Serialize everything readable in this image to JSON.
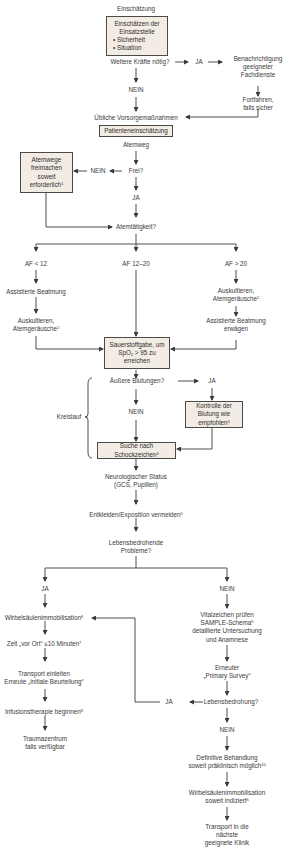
{
  "flowchart": {
    "title": "Einschätzung",
    "scene_box": {
      "heading": "Einschätzen der",
      "heading2": "Einsatzstelle",
      "bullets": [
        "• Sicherheit",
        "• Situation"
      ]
    },
    "more_forces_question": "Weitere Kräfte nötig?",
    "more_forces_yes": "JA",
    "notify": [
      "Benachrichtigung",
      "geeigneter",
      "Fachdienste"
    ],
    "continue_safe": [
      "Fortfahren,",
      "falls sicher"
    ],
    "more_forces_no": "NEIN",
    "usual_precautions": "Übliche Vorsorgemaßnahmen",
    "patient_assessment": "Patienteneinschätzung",
    "airway": "Atemweg",
    "airway_question": "Frei?",
    "airway_no": "NEIN",
    "airway_yes": "JA",
    "clear_airway_box": [
      "Atemwege",
      "freimachen",
      "soweit",
      "erforderlich"
    ],
    "clear_airway_note": "1",
    "breathing_question": "Atemtätigkeit?",
    "branches": {
      "low": {
        "label": "AF < 12",
        "step1": "Assistierte Beatmung",
        "step2": [
          "Auskultieren,",
          "Atemgeräusche"
        ],
        "step2_note": "2"
      },
      "normal": {
        "label": "AF 12–20"
      },
      "high": {
        "label": "AF > 20",
        "step1": [
          "Auskultieren,",
          "Atemgeräusche"
        ],
        "step1_note": "2",
        "step2": [
          "Assistierte Beatmung",
          "erwägen"
        ]
      }
    },
    "oxygen_box": {
      "line1": "Sauerstoffgabe, um",
      "line2_pre": "SpO",
      "line2_sub": "2",
      "line2_post": " > 95 zu",
      "line3": "erreichen"
    },
    "circulation_label": "Kreislauf",
    "bleeding_question": "Äußere Blutungen?",
    "bleeding_yes": "JA",
    "bleeding_no": "NEIN",
    "bleeding_control_box": [
      "Kontrolle der",
      "Blutung wie",
      "empfohlen"
    ],
    "bleeding_control_note": "3",
    "shock_box": [
      "Suche nach",
      "Schockzeichen"
    ],
    "shock_note": "4",
    "neuro_status": [
      "Neurologischer Status",
      "(GCS, Pupillen)"
    ],
    "exposure": "Entkleiden/Exposition vermeiden",
    "exposure_note": "5",
    "life_threat_question": [
      "Lebensbedrohende",
      "Probleme?"
    ],
    "left_path": {
      "label": "JA",
      "spine": "Wirbelsäulenimmobilisation",
      "spine_note": "6",
      "time": "Zeit „vor Ort“ ≤10 Minuten",
      "time_note": "7",
      "transport": [
        "Transport einleiten",
        "Erneute „initiale Beurteilung“"
      ],
      "infusion": "Infusionstherapie beginnen",
      "infusion_note": "8",
      "trauma_center": [
        "Traumazentrum",
        "falls verfügbar"
      ]
    },
    "right_path": {
      "label": "NEIN",
      "vitals": [
        "Vitalzeichen prüfen",
        "SAMPLE-Schema",
        "detaillierte Untersuchung",
        "und Anamnese"
      ],
      "vitals_note": "9",
      "primary_survey": [
        "Erneuter",
        "„Primary Survey“"
      ],
      "threat_question": "Lebensbedrohung?",
      "threat_yes": "JA",
      "threat_no": "NEIN",
      "definitive": [
        "Definitive Behandlung",
        "soweit präklinisch möglich"
      ],
      "definitive_note": "10",
      "spine": [
        "Wirbelsäulenimmobilisation",
        "soweit indiziert"
      ],
      "spine_note": "6",
      "transport": [
        "Transport in die",
        "nächste",
        "geeignete Klinik"
      ]
    }
  }
}
